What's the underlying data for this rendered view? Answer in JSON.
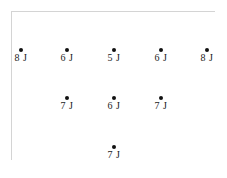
{
  "nodes": [
    {
      "label": "8 J",
      "x": 21,
      "y": 48
    },
    {
      "label": "6 J",
      "x": 67,
      "y": 48
    },
    {
      "label": "5 J",
      "x": 114,
      "y": 48
    },
    {
      "label": "6 J",
      "x": 161,
      "y": 48
    },
    {
      "label": "8 J",
      "x": 207,
      "y": 48
    },
    {
      "label": "7 J",
      "x": 67,
      "y": 96
    },
    {
      "label": "6 J",
      "x": 114,
      "y": 96
    },
    {
      "label": "7 J",
      "x": 161,
      "y": 96
    },
    {
      "label": "7 J",
      "x": 114,
      "y": 145
    }
  ],
  "colors": {
    "dot": "#111111",
    "frame": "#d4d4d4",
    "text": "#222222"
  }
}
